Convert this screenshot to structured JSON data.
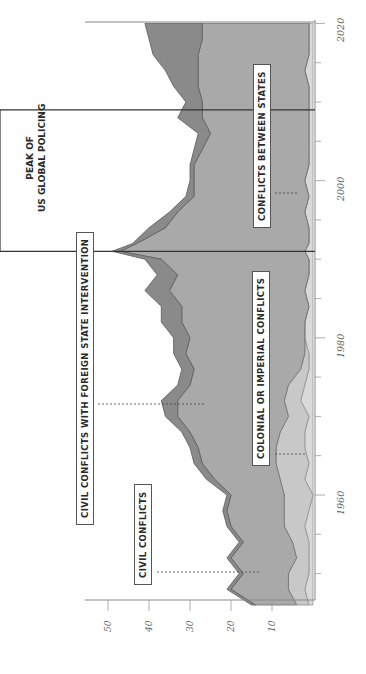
{
  "chart_data": {
    "type": "area",
    "orientation": "rotated-90-ccw",
    "title": "",
    "xlabel": "Year",
    "ylabel": "Number of conflicts",
    "x_ticks": [
      1960,
      1980,
      2000,
      2020
    ],
    "y_ticks": [
      10,
      20,
      30,
      40,
      50
    ],
    "ylim": [
      0,
      52
    ],
    "xlim": [
      1946,
      2020
    ],
    "stacked": true,
    "annotation": {
      "label_line1": "PEAK OF",
      "label_line2": "US GLOBAL POLICING",
      "start": 1991,
      "end": 2009
    },
    "x": [
      1946,
      1948,
      1950,
      1952,
      1954,
      1956,
      1958,
      1960,
      1962,
      1964,
      1966,
      1968,
      1970,
      1972,
      1974,
      1976,
      1978,
      1980,
      1982,
      1984,
      1986,
      1988,
      1990,
      1991,
      1992,
      1994,
      1996,
      1998,
      2000,
      2002,
      2004,
      2006,
      2008,
      2010,
      2012,
      2014,
      2016,
      2018,
      2020
    ],
    "series": [
      {
        "name": "Conflicts between states",
        "color": "#d9d9d9",
        "values": [
          1,
          2,
          1,
          1,
          1,
          2,
          1,
          0,
          2,
          1,
          2,
          2,
          1,
          3,
          2,
          1,
          1,
          2,
          2,
          1,
          2,
          1,
          1,
          2,
          1,
          1,
          2,
          1,
          2,
          1,
          1,
          1,
          1,
          1,
          1,
          2,
          1,
          1,
          1
        ]
      },
      {
        "name": "Colonial or imperial conflicts",
        "color": "#c8c8c8",
        "values": [
          3,
          4,
          5,
          3,
          4,
          5,
          6,
          7,
          6,
          8,
          7,
          6,
          5,
          4,
          4,
          2,
          1,
          0,
          0,
          0,
          0,
          0,
          0,
          0,
          0,
          0,
          0,
          0,
          0,
          0,
          0,
          0,
          0,
          0,
          0,
          0,
          0,
          0,
          0
        ]
      },
      {
        "name": "Civil conflicts",
        "color": "#a9a9a9",
        "values": [
          10,
          14,
          11,
          16,
          12,
          13,
          14,
          13,
          16,
          18,
          19,
          22,
          27,
          26,
          24,
          26,
          29,
          28,
          30,
          31,
          33,
          32,
          36,
          45,
          42,
          35,
          31,
          28,
          27,
          28,
          26,
          24,
          26,
          26,
          27,
          26,
          27,
          26,
          26
        ]
      },
      {
        "name": "Civil conflicts with foreign state intervention",
        "color": "#8a8a8a",
        "values": [
          1,
          1,
          1,
          1,
          1,
          1,
          1,
          1,
          2,
          2,
          2,
          2,
          3,
          4,
          3,
          3,
          3,
          4,
          5,
          5,
          6,
          5,
          4,
          2,
          1,
          4,
          2,
          2,
          1,
          1,
          2,
          3,
          6,
          4,
          6,
          8,
          11,
          13,
          14
        ]
      }
    ],
    "legend": [
      "CIVIL CONFLICTS",
      "CIVIL CONFLICTS WITH FOREIGN STATE INTERVENTION",
      "COLONIAL OR IMPERIAL CONFLICTS",
      "CONFLICTS BETWEEN STATES"
    ]
  },
  "labels": {
    "civil": "CIVIL CONFLICTS",
    "civil_foreign": "CIVIL CONFLICTS WITH FOREIGN STATE INTERVENTION",
    "colonial": "COLONIAL OR IMPERIAL CONFLICTS",
    "between": "CONFLICTS BETWEEN STATES",
    "peak1": "PEAK OF",
    "peak2": "US GLOBAL POLICING"
  },
  "ticks": {
    "y": [
      "10",
      "20",
      "30",
      "40",
      "50"
    ],
    "x": [
      "1960",
      "1980",
      "2000",
      "2020"
    ]
  }
}
